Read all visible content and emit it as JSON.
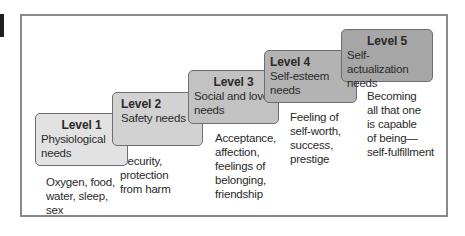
{
  "diagram": {
    "levels": [
      {
        "level": "Level 1",
        "name": "Physiological needs",
        "description": "Oxygen, food,\nwater, sleep,\nsex",
        "color": "#e2e2e2"
      },
      {
        "level": "Level 2",
        "name": "Safety needs",
        "description": "Security,\nprotection\nfrom harm",
        "color": "#d2d2d2"
      },
      {
        "level": "Level 3",
        "name": "Social and love needs",
        "description": "Acceptance,\naffection,\nfeelings of\nbelonging,\nfriendship",
        "color": "#c2c2c2"
      },
      {
        "level": "Level 4",
        "name": "Self-esteem needs",
        "description": "Feeling of\nself-worth,\nsuccess,\nprestige",
        "color": "#b3b3b3"
      },
      {
        "level": "Level 5",
        "name": "Self-actualization needs",
        "description": "Becoming\nall that one\nis capable\nof being—\nself-fulfillment",
        "color": "#a6a6a6"
      }
    ]
  }
}
